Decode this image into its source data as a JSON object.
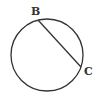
{
  "diagram": {
    "type": "circle-with-chord",
    "circle": {
      "cx": 47,
      "cy": 55,
      "r": 36,
      "stroke": "#333333"
    },
    "chord": {
      "from": "B",
      "to": "C"
    },
    "points": [
      {
        "name": "B",
        "x": 38,
        "y": 20,
        "label_x": 31,
        "label_y": 15
      },
      {
        "name": "C",
        "x": 81,
        "y": 67,
        "label_x": 84,
        "label_y": 75
      }
    ]
  }
}
